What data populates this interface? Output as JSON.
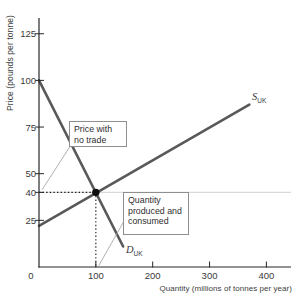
{
  "figure": {
    "y_axis_title": "Price (pounds per tonne)",
    "x_axis_title": "Quantity (millions of tonnes per year)",
    "origin_label": "0"
  },
  "annotations": {
    "price_note": "Price with no trade",
    "quantity_note": "Quantity produced and consumed"
  },
  "curve_labels": {
    "supply": {
      "symbol": "S",
      "subscript": "UK"
    },
    "demand": {
      "symbol": "D",
      "subscript": "UK"
    }
  },
  "colors": {
    "curve": "#59595b",
    "axis": "#272727",
    "dotted_guide": "#1a1a1a",
    "reference_line": "#d9d9d9",
    "callout_line": "#a8a8a8",
    "equilibrium_dot": "#101010",
    "box_border": "#8f8f8f",
    "text": "#3a3a3a"
  },
  "chart_data": {
    "type": "line",
    "title": "",
    "xlabel": "Quantity (millions of tonnes per year)",
    "ylabel": "Price (pounds per tonne)",
    "xlim": [
      0,
      443
    ],
    "ylim": [
      0,
      133
    ],
    "x_ticks": [
      100,
      200,
      300,
      400
    ],
    "y_ticks": [
      25,
      40,
      50,
      75,
      100,
      125
    ],
    "grid": "none",
    "legend": "curve-end labels",
    "series": [
      {
        "name": "S_UK",
        "role": "supply",
        "points": [
          [
            0,
            22
          ],
          [
            370,
            87
          ]
        ]
      },
      {
        "name": "D_UK",
        "role": "demand",
        "points": [
          [
            0,
            100
          ],
          [
            148,
            11
          ]
        ]
      }
    ],
    "equilibrium": {
      "quantity": 100,
      "price": 40,
      "marker": "black dot"
    },
    "reference_price_line": 40,
    "dotted_guides": [
      {
        "type": "horizontal",
        "at_price": 40,
        "from_quantity": 0,
        "to_quantity": 100
      },
      {
        "type": "vertical",
        "at_quantity": 100,
        "from_price": 0,
        "to_price": 40
      }
    ],
    "annotations": [
      {
        "text": "Price with no trade",
        "points_to": "price axis at 40"
      },
      {
        "text": "Quantity produced and consumed",
        "points_to": "quantity axis at 100"
      }
    ]
  }
}
